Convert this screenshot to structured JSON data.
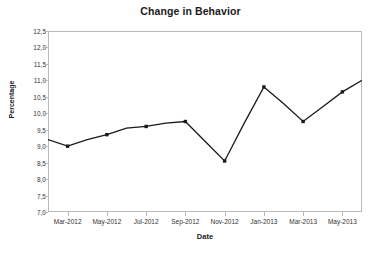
{
  "chart_data": {
    "type": "line",
    "title": "Change in Behavior",
    "xlabel": "Date",
    "ylabel": "Percentage",
    "ylim": [
      7.0,
      12.5
    ],
    "ytick_labels": [
      "12,5",
      "12,0",
      "11,5",
      "11,0",
      "10,5",
      "10,0",
      "9,5",
      "9,0",
      "8,5",
      "8,0",
      "7,5",
      "7,0"
    ],
    "ytick_values": [
      12.5,
      12.0,
      11.5,
      11.0,
      10.5,
      10.0,
      9.5,
      9.0,
      8.5,
      8.0,
      7.5,
      7.0
    ],
    "xtick_labels": [
      "Mar-2012",
      "May-2012",
      "Jul-2012",
      "Sep-2012",
      "Nov-2012",
      "Jan-2013",
      "Mar-2013",
      "May-2013"
    ],
    "xtick_index": [
      1,
      3,
      5,
      7,
      9,
      11,
      13,
      15
    ],
    "x": [
      "Feb-2012",
      "Mar-2012",
      "Apr-2012",
      "May-2012",
      "Jun-2012",
      "Jul-2012",
      "Aug-2012",
      "Sep-2012",
      "Oct-2012",
      "Nov-2012",
      "Dec-2012",
      "Jan-2013",
      "Feb-2013",
      "Mar-2013",
      "Apr-2013",
      "May-2013",
      "Jun-2013"
    ],
    "values": [
      9.2,
      9.0,
      9.2,
      9.35,
      9.55,
      9.6,
      9.7,
      9.75,
      9.15,
      8.55,
      9.7,
      10.8,
      10.3,
      9.75,
      10.2,
      10.65,
      11.0
    ],
    "marker_index": [
      1,
      3,
      5,
      7,
      9,
      11,
      13,
      15
    ],
    "grid": false,
    "legend": "none",
    "line_color": "#1a1a1a",
    "marker_color": "#1a1a1a",
    "frame_color": "#b9b9b9",
    "background": "#ffffff"
  }
}
